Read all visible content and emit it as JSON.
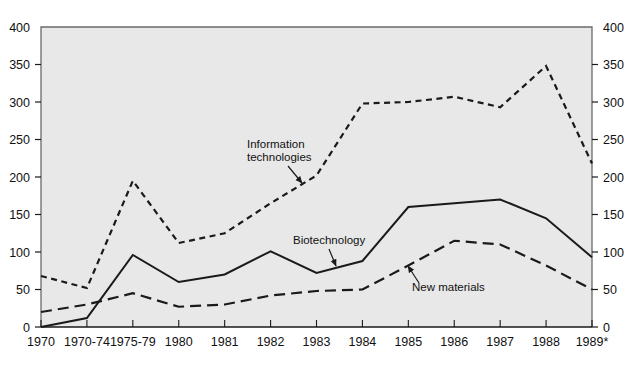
{
  "chart_data": {
    "type": "line",
    "title": "",
    "subtitle": "",
    "xlabel": "",
    "ylabel": "",
    "grid": false,
    "legend_position": "inline-annotations",
    "ylim": [
      0,
      400
    ],
    "ytick_values": [
      0,
      50,
      100,
      150,
      200,
      250,
      300,
      350,
      400
    ],
    "ytick_labels": [
      "0",
      "50",
      "100",
      "150",
      "200",
      "250",
      "300",
      "350",
      "400"
    ],
    "y_axis_left_labels": [
      "400",
      "350",
      "300",
      "250",
      "200",
      "150",
      "100",
      "50",
      "0"
    ],
    "y_axis_right_labels": [
      "400",
      "350",
      "300",
      "250",
      "200",
      "150",
      "100",
      "50",
      "0"
    ],
    "categories": [
      "1970",
      "1970-74",
      "1975-79",
      "1980",
      "1981",
      "1982",
      "1983",
      "1984",
      "1985",
      "1986",
      "1987",
      "1988",
      "1989*"
    ],
    "series": [
      {
        "name": "Information technologies",
        "style": "short-dashed",
        "color": "#1a1a1a",
        "values": [
          68,
          52,
          195,
          112,
          125,
          165,
          202,
          298,
          300,
          307,
          293,
          348,
          218
        ]
      },
      {
        "name": "Biotechnology",
        "style": "solid",
        "color": "#1a1a1a",
        "values": [
          0,
          12,
          96,
          60,
          70,
          101,
          72,
          88,
          160,
          165,
          170,
          145,
          93
        ]
      },
      {
        "name": "New materials",
        "style": "long-dashed",
        "color": "#1a1a1a",
        "values": [
          20,
          30,
          45,
          27,
          30,
          42,
          48,
          50,
          82,
          115,
          110,
          82,
          50
        ]
      }
    ],
    "annotations": [
      {
        "text_line1": "Information",
        "text_line2": "technologies",
        "series": "Information technologies"
      },
      {
        "text_line1": "Biotechnology",
        "text_line2": "",
        "series": "Biotechnology"
      },
      {
        "text_line1": "New materials",
        "text_line2": "",
        "series": "New materials"
      }
    ],
    "colors": {
      "plot_background": "#e8e8e8",
      "page_background": "#ffffff",
      "axis": "#555555",
      "ink": "#1a1a1a"
    }
  }
}
